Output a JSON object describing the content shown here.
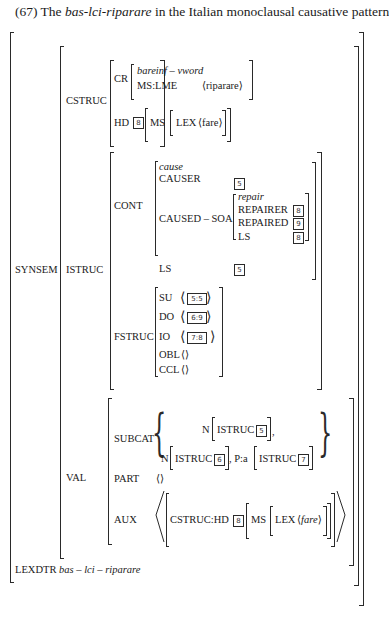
{
  "title": {
    "prefix": "(67) The ",
    "term": "bas-lci-riparare",
    "suffix": " in the Italian monoclausal causative pattern"
  },
  "avm": {
    "synsem": "SYNSEM",
    "cstruc": {
      "label": "CSTRUC",
      "cr": {
        "label": "CR",
        "type": "bareinf – vword",
        "ms_lme": "MS:LME",
        "value": "⟨riparare⟩"
      },
      "hd": {
        "label": "HD",
        "tag": "8",
        "ms": "MS",
        "lex": "LEX",
        "value": "⟨fare⟩"
      }
    },
    "istruc": {
      "label": "ISTRUC",
      "cont": {
        "label": "CONT",
        "type": "cause",
        "causer": {
          "label": "CAUSER",
          "tag": "5"
        },
        "caused_soa": {
          "label": "CAUSED – SOA",
          "type": "repair",
          "repairer": {
            "label": "REPAIRER",
            "tag": "8"
          },
          "repaired": {
            "label": "REPAIRED",
            "tag": "9"
          },
          "ls": {
            "label": "LS",
            "tag": "8"
          }
        },
        "ls": {
          "label": "LS",
          "tag": "5"
        }
      },
      "fstruc": {
        "label": "FSTRUC",
        "su": {
          "label": "SU",
          "value": "5:5"
        },
        "do": {
          "label": "DO",
          "value": "6:9"
        },
        "io": {
          "label": "IO",
          "value": "7:8"
        },
        "obl": {
          "label": "OBL",
          "value": "⟨⟩"
        },
        "ccl": {
          "label": "CCL",
          "value": "⟨⟩"
        }
      }
    },
    "val": {
      "label": "VAL",
      "subcat": {
        "label": "SUBCAT",
        "n1": "N",
        "istruc1": "ISTRUC",
        "tag1": "5",
        "comma1": ",",
        "n2": "N",
        "istruc2": "ISTRUC",
        "tag2": "6",
        "p": ", P:a",
        "istruc3": "ISTRUC",
        "tag3": "7"
      },
      "part": {
        "label": "PART",
        "value": "⟨⟩"
      },
      "aux": {
        "label": "AUX",
        "cstruc_hd": "CSTRUC:HD",
        "tag": "8",
        "ms": "MS",
        "lex": "LEX",
        "value_open": "⟨",
        "value": "fare",
        "value_close": "⟩"
      }
    },
    "lexdtr": {
      "label": "LEXDTR",
      "value": "bas – lci – riparare"
    }
  }
}
